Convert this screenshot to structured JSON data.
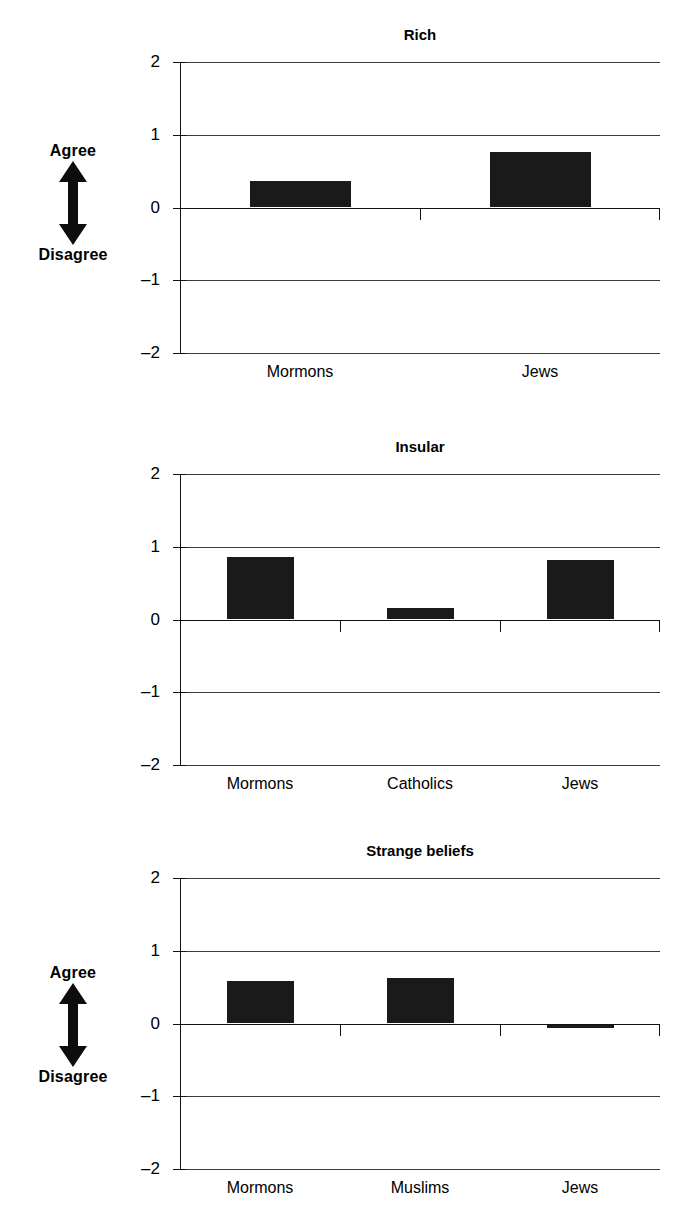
{
  "figure": {
    "axis_annotation": {
      "top_label": "Agree",
      "bottom_label": "Disagree",
      "arrow_icon": "double-headed-vertical-arrow-icon"
    }
  },
  "chart_data": [
    {
      "type": "bar",
      "title": "Rich",
      "categories": [
        "Mormons",
        "Jews"
      ],
      "values": [
        0.37,
        0.76
      ],
      "xlabel": "",
      "ylabel": "Agree / Disagree",
      "ylim": [
        -2,
        2
      ],
      "yticks": [
        2,
        1,
        0,
        -1,
        -2
      ],
      "ytick_labels": [
        "2",
        "1",
        "0",
        "–1",
        "–2"
      ],
      "grid": true,
      "legend": "none",
      "bar_color": "#1a1a1a"
    },
    {
      "type": "bar",
      "title": "Insular",
      "categories": [
        "Mormons",
        "Catholics",
        "Jews"
      ],
      "values": [
        0.86,
        0.16,
        0.82
      ],
      "xlabel": "",
      "ylabel": "Agree / Disagree",
      "ylim": [
        -2,
        2
      ],
      "yticks": [
        2,
        1,
        0,
        -1,
        -2
      ],
      "ytick_labels": [
        "2",
        "1",
        "0",
        "–1",
        "–2"
      ],
      "grid": true,
      "legend": "none",
      "bar_color": "#1a1a1a"
    },
    {
      "type": "bar",
      "title": "Strange beliefs",
      "categories": [
        "Mormons",
        "Muslims",
        "Jews"
      ],
      "values": [
        0.58,
        0.63,
        -0.02
      ],
      "xlabel": "",
      "ylabel": "Agree / Disagree",
      "ylim": [
        -2,
        2
      ],
      "yticks": [
        2,
        1,
        0,
        -1,
        -2
      ],
      "ytick_labels": [
        "2",
        "1",
        "0",
        "–1",
        "–2"
      ],
      "grid": true,
      "legend": "none",
      "bar_color": "#1a1a1a"
    }
  ]
}
